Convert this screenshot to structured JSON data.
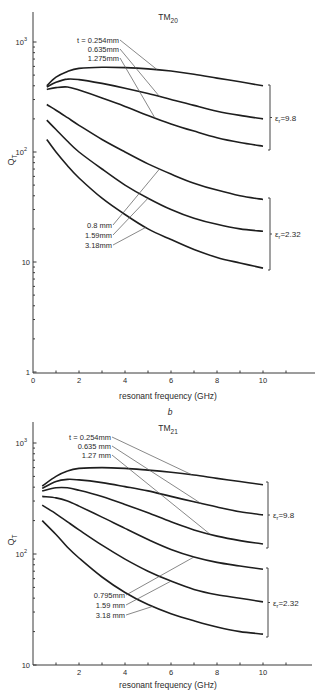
{
  "chart_data": [
    {
      "type": "line",
      "panel_label": "",
      "title": "TM20",
      "title_main": "TM",
      "title_sub": "20",
      "xlabel": "resonant frequency (GHz)",
      "ylabel": "Q_T",
      "ylabel_main": "Q",
      "ylabel_sub": "T",
      "yscale": "log",
      "xlim": [
        0,
        12
      ],
      "ylim": [
        1,
        1500
      ],
      "xticks": [
        0,
        2,
        4,
        6,
        8,
        10
      ],
      "yticks": [
        {
          "value": 1,
          "label": "1"
        },
        {
          "value": 10,
          "label": "10"
        },
        {
          "value": 100,
          "label": "10",
          "sup": "2"
        },
        {
          "value": 1000,
          "label": "10",
          "sup": "3"
        }
      ],
      "grid": false,
      "thickness_labels_top": [
        "t = 0.254mm",
        "0.635mm",
        "1.275mm"
      ],
      "thickness_labels_bottom": [
        "0.8  mm",
        "1.59mm",
        "3.18mm"
      ],
      "groups": [
        {
          "label": "εr = 9.8",
          "label_main": "ε",
          "label_sub": "r",
          "label_rest": "=9.8",
          "series_indices": [
            0,
            1,
            2
          ]
        },
        {
          "label": "εr = 2.32",
          "label_main": "ε",
          "label_sub": "r",
          "label_rest": "=2.32",
          "series_indices": [
            3,
            4,
            5
          ]
        }
      ],
      "x": [
        0.6,
        1,
        1.5,
        2,
        3,
        4,
        5,
        6,
        7,
        8,
        9,
        10
      ],
      "series": [
        {
          "name": "εr=9.8, t=0.254mm",
          "values": [
            400,
            480,
            540,
            575,
            590,
            585,
            570,
            545,
            510,
            470,
            435,
            400
          ]
        },
        {
          "name": "εr=9.8, t=0.635mm",
          "values": [
            390,
            430,
            460,
            455,
            420,
            380,
            340,
            300,
            265,
            235,
            215,
            200
          ]
        },
        {
          "name": "εr=9.8, t=1.275mm",
          "values": [
            370,
            385,
            390,
            365,
            310,
            260,
            215,
            180,
            155,
            135,
            122,
            113
          ]
        },
        {
          "name": "εr=2.32, t=0.8mm",
          "values": [
            270,
            240,
            205,
            175,
            130,
            100,
            78,
            63,
            52,
            45,
            40,
            37
          ]
        },
        {
          "name": "εr=2.32, t=1.59mm",
          "values": [
            195,
            160,
            125,
            100,
            70,
            50,
            38,
            30,
            25,
            22,
            20,
            19
          ]
        },
        {
          "name": "εr=2.32, t=3.18mm",
          "values": [
            130,
            100,
            75,
            58,
            38,
            27,
            20,
            16,
            13,
            11,
            9.8,
            8.8
          ]
        }
      ]
    },
    {
      "type": "line",
      "panel_label": "b",
      "title": "TM21",
      "title_main": "TM",
      "title_sub": "21",
      "xlabel": "resonant frequency (GHz)",
      "ylabel": "Q_T",
      "ylabel_main": "Q",
      "ylabel_sub": "T",
      "yscale": "log",
      "xlim": [
        0,
        12
      ],
      "ylim": [
        10,
        1500
      ],
      "xticks": [
        2,
        4,
        6,
        8,
        10
      ],
      "yticks": [
        {
          "value": 10,
          "label": "10"
        },
        {
          "value": 100,
          "label": "10",
          "sup": "2"
        },
        {
          "value": 1000,
          "label": "10",
          "sup": "3"
        }
      ],
      "grid": false,
      "thickness_labels_top": [
        "t = 0.254mm",
        "0.635 mm",
        "1.27  mm"
      ],
      "thickness_labels_bottom": [
        "0.795mm",
        "1.59 mm",
        "3.18  mm"
      ],
      "groups": [
        {
          "label": "εr = 9.8",
          "label_main": "ε",
          "label_sub": "r",
          "label_rest": "=9.8",
          "series_indices": [
            0,
            1,
            2
          ]
        },
        {
          "label": "εr = 2.32",
          "label_main": "ε",
          "label_sub": "r",
          "label_rest": "=2.32",
          "series_indices": [
            3,
            4,
            5
          ]
        }
      ],
      "x": [
        0.4,
        1,
        1.5,
        2,
        3,
        4,
        5,
        6,
        7,
        8,
        9,
        10
      ],
      "series": [
        {
          "name": "εr=9.8, t=0.254mm",
          "values": [
            410,
            500,
            560,
            590,
            600,
            590,
            570,
            545,
            515,
            480,
            450,
            420
          ]
        },
        {
          "name": "εr=9.8, t=0.635mm",
          "values": [
            390,
            450,
            470,
            465,
            440,
            405,
            370,
            330,
            295,
            265,
            240,
            225
          ]
        },
        {
          "name": "εr=9.8, t=1.27mm",
          "values": [
            370,
            395,
            395,
            375,
            330,
            280,
            235,
            195,
            165,
            145,
            132,
            123
          ]
        },
        {
          "name": "εr=2.32, t=0.795mm",
          "values": [
            330,
            320,
            300,
            270,
            215,
            170,
            135,
            110,
            94,
            84,
            78,
            73
          ]
        },
        {
          "name": "εr=2.32, t=1.59mm",
          "values": [
            275,
            230,
            195,
            165,
            120,
            90,
            70,
            57,
            48,
            43,
            40,
            37
          ]
        },
        {
          "name": "εr=2.32, t=3.18mm",
          "values": [
            200,
            150,
            115,
            92,
            62,
            45,
            35,
            29,
            25,
            22,
            20,
            19
          ]
        }
      ]
    }
  ]
}
